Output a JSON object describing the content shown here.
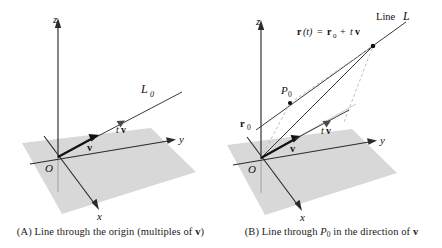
{
  "figure": {
    "type": "math-diagram",
    "background_color": "#ffffff",
    "plane_color": "#d8d8d8",
    "axis_color": "#2b2b2b"
  },
  "panel_a": {
    "caption_prefix": "(A) Line through the origin (multiples of ",
    "caption_vector": "v",
    "caption_suffix": ")",
    "axes": {
      "z": "z",
      "y": "y",
      "x": "x"
    },
    "origin_label": "O",
    "line_label_main": "L",
    "line_label_sub": "0",
    "vector_label": "v",
    "scaled_vector_prefix": "t",
    "scaled_vector_name": "v"
  },
  "panel_b": {
    "caption_prefix": "(B) Line through ",
    "caption_point": "P",
    "caption_point_sub": "0",
    "caption_middle": " in the direction of ",
    "caption_vector": "v",
    "axes": {
      "z": "z",
      "y": "y",
      "x": "x"
    },
    "origin_label": "O",
    "line_label": "Line",
    "line_label_script": "L",
    "equation": {
      "r_of_t": "r",
      "paren_t": "(t)",
      "equals": "=",
      "r0": "r",
      "r0_sub": "0",
      "plus": "+",
      "tv_t": "t",
      "tv_v": "v"
    },
    "point_label": "P",
    "point_label_sub": "0",
    "position_vector": "r",
    "position_vector_sub": "0",
    "vector_label": "v",
    "scaled_vector_prefix": "t",
    "scaled_vector_name": "v"
  }
}
